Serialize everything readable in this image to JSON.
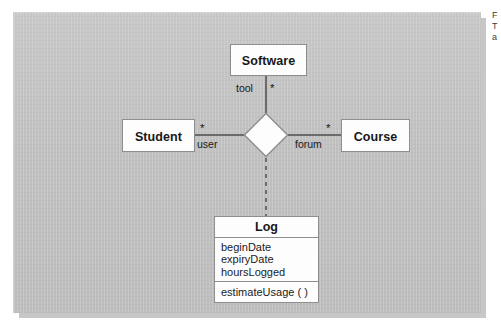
{
  "figure": {
    "kind": "uml-n-ary-association-diagram",
    "panel_color": "#c2c2c2",
    "box_fill": "#fdfdfd",
    "line_color": "#6b6b6b"
  },
  "classes": {
    "software": {
      "name": "Software"
    },
    "student": {
      "name": "Student"
    },
    "course": {
      "name": "Course"
    },
    "log": {
      "name": "Log",
      "attributes": [
        "beginDate",
        "expiryDate",
        "hoursLogged"
      ],
      "operations": [
        "estimateUsage ( )"
      ]
    }
  },
  "associations": {
    "software_end": {
      "multiplicity": "*",
      "role": "tool"
    },
    "student_end": {
      "multiplicity": "*",
      "role": "user"
    },
    "course_end": {
      "multiplicity": "*",
      "role": "forum"
    }
  },
  "edge_caption": {
    "line1": "F",
    "line2": "T",
    "line3": "a"
  }
}
